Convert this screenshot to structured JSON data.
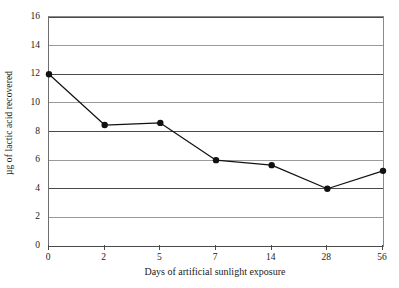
{
  "chart_data": {
    "type": "line",
    "title": "",
    "subtitle": "",
    "xlabel": "Days of artificial sunlight exposure",
    "ylabel": "µg of lactic acid recovered",
    "categories": [
      "0",
      "2",
      "5",
      "7",
      "14",
      "28",
      "56"
    ],
    "values": [
      12.0,
      8.45,
      8.6,
      6.0,
      5.65,
      4.0,
      5.25
    ],
    "series": [
      {
        "name": "Lactic acid recovered",
        "values": [
          12.0,
          8.45,
          8.6,
          6.0,
          5.65,
          4.0,
          5.25
        ]
      }
    ],
    "ylim": [
      0,
      16
    ],
    "xlim_categorical": true,
    "y_ticks": [
      0,
      2,
      4,
      6,
      8,
      10,
      12,
      14,
      16
    ],
    "y_tick_labels": [
      "0",
      "2",
      "4",
      "6",
      "8",
      "10",
      "12",
      "14",
      "16"
    ],
    "x_tick_labels": [
      "0",
      "2",
      "5",
      "7",
      "14",
      "28",
      "56"
    ],
    "grid": {
      "horizontal": true,
      "vertical": false
    },
    "legend": {
      "visible": false,
      "position": "none"
    },
    "marker": "filled-circle",
    "colors": {
      "line": "#111111",
      "marker": "#111111",
      "gridline": "#9a9a9a",
      "axis": "#4a4a4a",
      "background": "#ffffff",
      "text": "#1a1a1a"
    }
  }
}
